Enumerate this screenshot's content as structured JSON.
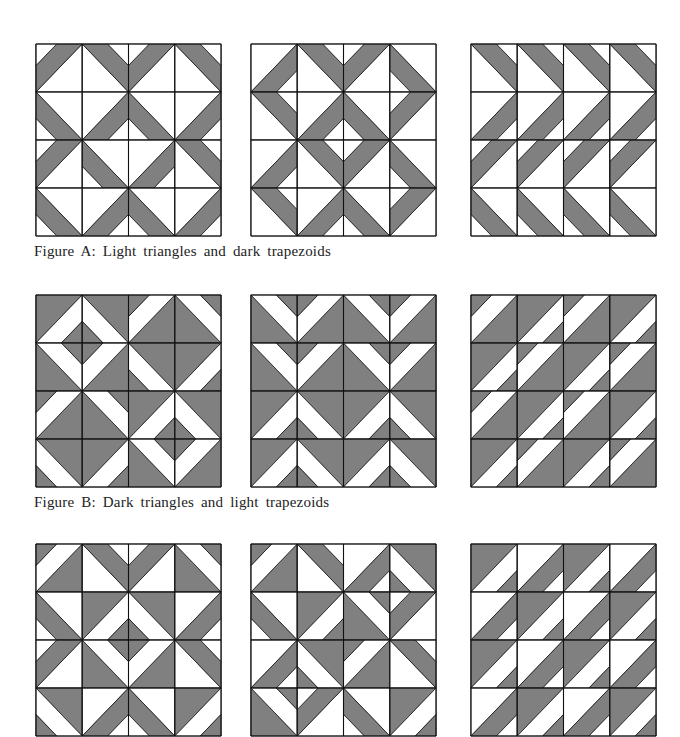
{
  "colors": {
    "dark": "#808080",
    "light": "#ffffff",
    "line": "#111111"
  },
  "tile_legend": {
    "diag": "'/' = bottom-left to top-right, '\\' = top-left to bottom-right",
    "corner": "corner holding the small triangle; the band lies between it and the diagonal",
    "type": "A = light triangles + dark trapezoid, B = dark triangles + light trapezoid"
  },
  "groups": [
    {
      "caption": "Figure A: Light triangles and dark trapezoids",
      "panels": [
        {
          "id": "A1",
          "tiles": [
            [
              "A/TL",
              "A\\TR",
              "A/TL",
              "A\\TR"
            ],
            [
              "A\\BL",
              "A/BR",
              "A\\BL",
              "A/BR"
            ],
            [
              "A/TL",
              "A\\BL",
              "A/BR",
              "A\\TR"
            ],
            [
              "A\\BL",
              "A/BR",
              "A\\BL",
              "A/BR"
            ]
          ]
        },
        {
          "id": "A2",
          "tiles": [
            [
              "A/BR",
              "A\\TR",
              "A/TL",
              "A\\BL"
            ],
            [
              "A\\TR",
              "A/BR",
              "A\\BL",
              "A/TL"
            ],
            [
              "A/BR",
              "A\\TR",
              "A/TL",
              "A\\BL"
            ],
            [
              "A\\TR",
              "A/BR",
              "A\\BL",
              "A/TL"
            ]
          ]
        },
        {
          "id": "A3",
          "tiles": [
            [
              "A\\TR",
              "A\\TR",
              "A\\TR",
              "A\\TR"
            ],
            [
              "A/BR",
              "A/BR",
              "A/BR",
              "A/BR"
            ],
            [
              "A/TL",
              "A/TL",
              "A/TL",
              "A/TL"
            ],
            [
              "A\\BL",
              "A\\BL",
              "A\\BL",
              "A\\BL"
            ]
          ]
        }
      ]
    },
    {
      "caption": "Figure B: Dark triangles and light trapezoids",
      "panels": [
        {
          "id": "B1",
          "tiles": [
            [
              "B/BR",
              "B\\BL",
              "B/TL",
              "B\\TR"
            ],
            [
              "B\\TR",
              "B/TL",
              "B\\BL",
              "B/BR"
            ],
            [
              "B/TL",
              "B\\TR",
              "B/BR",
              "B\\BL"
            ],
            [
              "B\\BL",
              "B/BR",
              "B\\TR",
              "B/TL"
            ]
          ]
        },
        {
          "id": "B2",
          "tiles": [
            [
              "B\\TR",
              "B/TL",
              "B\\TR",
              "B/TL"
            ],
            [
              "B\\TR",
              "B/TL",
              "B\\TR",
              "B/TL"
            ],
            [
              "B/BR",
              "B\\BL",
              "B/BR",
              "B\\BL"
            ],
            [
              "B/BR",
              "B\\BL",
              "B/BR",
              "B\\BL"
            ]
          ]
        },
        {
          "id": "B3",
          "tiles": [
            [
              "B/TL",
              "B/BR",
              "B/TL",
              "B/BR"
            ],
            [
              "B/BR",
              "B/TL",
              "B/BR",
              "B/TL"
            ],
            [
              "B/TL",
              "B/BR",
              "B/TL",
              "B/BR"
            ],
            [
              "B/BR",
              "B/TL",
              "B/BR",
              "B/TL"
            ]
          ]
        }
      ]
    },
    {
      "caption": "",
      "panels": [
        {
          "id": "C1",
          "tiles": [
            [
              "B/TL",
              "A\\TR",
              "A/TL",
              "B\\TR"
            ],
            [
              "A\\BL",
              "B/BR",
              "B\\BL",
              "A/BR"
            ],
            [
              "A/TL",
              "B\\TR",
              "B/TL",
              "A\\TR"
            ],
            [
              "B\\BL",
              "A/BR",
              "A\\BL",
              "B/BR"
            ]
          ]
        },
        {
          "id": "C2",
          "tiles": [
            [
              "B/TL",
              "A\\TR",
              "A/BR",
              "B\\BL"
            ],
            [
              "A\\BL",
              "B/BR",
              "B\\TR",
              "A/TL"
            ],
            [
              "A/BR",
              "B\\BL",
              "B/TL",
              "A\\TR"
            ],
            [
              "B\\TR",
              "A/TL",
              "A\\BL",
              "B/BR"
            ]
          ]
        },
        {
          "id": "C3",
          "tiles": [
            [
              "B/BR",
              "A/BR",
              "B/BR",
              "A/BR"
            ],
            [
              "A/BR",
              "B/BR",
              "A/BR",
              "B/BR"
            ],
            [
              "B/BR",
              "A/BR",
              "B/BR",
              "A/BR"
            ],
            [
              "A/BR",
              "B/BR",
              "A/BR",
              "B/BR"
            ]
          ]
        }
      ]
    }
  ]
}
